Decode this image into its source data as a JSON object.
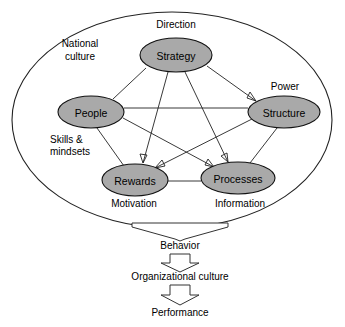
{
  "diagram": {
    "colors": {
      "node_fill": "#a9a9a9",
      "node_stroke": "#111111",
      "line": "#222222",
      "arrow_fill": "#ffffff",
      "background": "#ffffff"
    },
    "boundary": {
      "label": "National culture",
      "label_line1": "National",
      "label_line2": "culture",
      "shape": "ellipse"
    },
    "nodes": [
      {
        "id": "strategy",
        "label": "Strategy",
        "cx": 176,
        "cy": 55,
        "rx": 36,
        "ry": 17
      },
      {
        "id": "people",
        "label": "People",
        "cx": 91,
        "cy": 112,
        "rx": 33,
        "ry": 16
      },
      {
        "id": "structure",
        "label": "Structure",
        "cx": 284,
        "cy": 112,
        "rx": 36,
        "ry": 16
      },
      {
        "id": "rewards",
        "label": "Rewards",
        "cx": 135,
        "cy": 180,
        "rx": 33,
        "ry": 16
      },
      {
        "id": "processes",
        "label": "Processes",
        "cx": 238,
        "cy": 178,
        "rx": 37,
        "ry": 16
      }
    ],
    "annotations": [
      {
        "id": "direction",
        "text": "Direction",
        "x": 176,
        "y": 26
      },
      {
        "id": "power",
        "text": "Power",
        "x": 284,
        "y": 88
      },
      {
        "id": "skills",
        "text": "Skills &",
        "x": 52,
        "y": 140
      },
      {
        "id": "mindsets",
        "text": "mindsets",
        "x": 52,
        "y": 152
      },
      {
        "id": "motivation",
        "text": "Motivation",
        "x": 134,
        "y": 205
      },
      {
        "id": "information",
        "text": "Information",
        "x": 240,
        "y": 205
      }
    ],
    "links": [
      {
        "from": "strategy",
        "to": "people",
        "arrow": "none"
      },
      {
        "from": "strategy",
        "to": "structure",
        "arrow": "to"
      },
      {
        "from": "strategy",
        "to": "rewards",
        "arrow": "to"
      },
      {
        "from": "strategy",
        "to": "processes",
        "arrow": "to"
      },
      {
        "from": "people",
        "to": "structure",
        "arrow": "none"
      },
      {
        "from": "people",
        "to": "rewards",
        "arrow": "none"
      },
      {
        "from": "people",
        "to": "processes",
        "arrow": "to"
      },
      {
        "from": "structure",
        "to": "rewards",
        "arrow": "to"
      },
      {
        "from": "structure",
        "to": "processes",
        "arrow": "none"
      },
      {
        "from": "rewards",
        "to": "processes",
        "arrow": "none"
      }
    ],
    "flow": {
      "steps": [
        {
          "id": "behavior",
          "label": "Behavior",
          "x": 180,
          "y": 246
        },
        {
          "id": "org-culture",
          "label": "Organizational culture",
          "x": 180,
          "y": 276
        },
        {
          "id": "performance",
          "label": "Performance",
          "x": 180,
          "y": 312
        }
      ],
      "arrows": [
        {
          "id": "arrow-to-behavior",
          "width": "wide"
        },
        {
          "id": "arrow-to-org-culture",
          "width": "narrow"
        },
        {
          "id": "arrow-to-performance",
          "width": "narrow"
        }
      ]
    }
  }
}
